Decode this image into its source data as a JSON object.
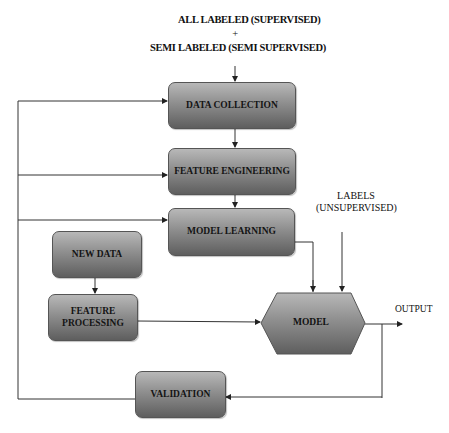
{
  "diagram": {
    "type": "flowchart",
    "inputs": {
      "line1": "ALL LABELED (SUPERVISED)",
      "plus": "+",
      "line2": "SEMI LABELED (SEMI   SUPERVISED)"
    },
    "nodes": {
      "data_collection": "DATA COLLECTION",
      "feature_engineering": "FEATURE ENGINEERING",
      "model_learning": "MODEL LEARNING",
      "new_data": "NEW DATA",
      "feature_processing_1": "FEATURE",
      "feature_processing_2": "PROCESSING",
      "model": "MODEL",
      "validation": "VALIDATION"
    },
    "labels": {
      "unsupervised_1": "LABELS",
      "unsupervised_2": "(UNSUPERVISED)",
      "output": "OUTPUT"
    },
    "edges": [
      {
        "from": "inputs",
        "to": "DATA COLLECTION"
      },
      {
        "from": "DATA COLLECTION",
        "to": "FEATURE ENGINEERING"
      },
      {
        "from": "FEATURE ENGINEERING",
        "to": "MODEL LEARNING"
      },
      {
        "from": "MODEL LEARNING",
        "to": "MODEL"
      },
      {
        "from": "LABELS (UNSUPERVISED)",
        "to": "MODEL"
      },
      {
        "from": "NEW DATA",
        "to": "FEATURE PROCESSING"
      },
      {
        "from": "FEATURE PROCESSING",
        "to": "MODEL"
      },
      {
        "from": "MODEL",
        "to": "OUTPUT"
      },
      {
        "from": "OUTPUT",
        "to": "VALIDATION"
      },
      {
        "from": "VALIDATION",
        "to": "DATA COLLECTION"
      },
      {
        "from": "VALIDATION",
        "to": "FEATURE ENGINEERING"
      },
      {
        "from": "VALIDATION",
        "to": "MODEL LEARNING"
      }
    ],
    "colors": {
      "box_top": "#b8b8b8",
      "box_bottom": "#5e5e5e",
      "line": "#333333"
    }
  }
}
